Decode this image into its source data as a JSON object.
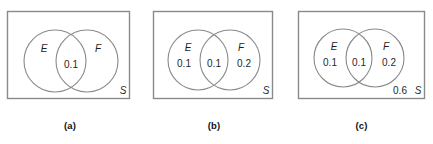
{
  "figure": {
    "colors": {
      "stroke": "#8a8a8a",
      "rect_stroke": "#8a8a8a",
      "text": "#1f1f1f",
      "background": "#ffffff"
    }
  },
  "panels": [
    {
      "id": "a",
      "caption": "(a)",
      "universe_label": "S",
      "set_e_label": "E",
      "set_f_label": "F",
      "value_e_only": "",
      "value_intersection": "0.1",
      "value_f_only": "",
      "value_outside": ""
    },
    {
      "id": "b",
      "caption": "(b)",
      "universe_label": "S",
      "set_e_label": "E",
      "set_f_label": "F",
      "value_e_only": "0.1",
      "value_intersection": "0.1",
      "value_f_only": "0.2",
      "value_outside": ""
    },
    {
      "id": "c",
      "caption": "(c)",
      "universe_label": "S",
      "set_e_label": "E",
      "set_f_label": "F",
      "value_e_only": "0.1",
      "value_intersection": "0.1",
      "value_f_only": "0.2",
      "value_outside": "0.6"
    }
  ]
}
